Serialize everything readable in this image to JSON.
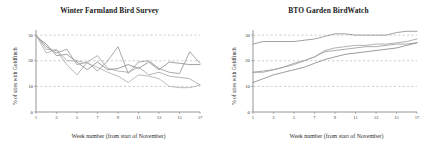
{
  "figure": {
    "panel_count": 2
  },
  "axis_common": {
    "ylabel": "% of sites with Goldfinch",
    "xlabel": "Week number (from start of November)",
    "yticks": [
      "0",
      "10",
      "20",
      "30"
    ],
    "xticks": [
      "1",
      "3",
      "5",
      "7",
      "9",
      "11",
      "13",
      "15",
      "17"
    ],
    "gridline_color": "#b9b9b9",
    "axis_color": "#8a8a8a"
  },
  "chart_data": [
    {
      "type": "line",
      "title": "Winter Farmland Bird Survey",
      "xlabel": "Week number (from start of November)",
      "ylabel": "% of sites with Goldfinch",
      "x": [
        1,
        2,
        3,
        4,
        5,
        6,
        7,
        8,
        9,
        10,
        11,
        12,
        13,
        14,
        15,
        16,
        17
      ],
      "xlim": [
        1,
        17
      ],
      "ylim": [
        0,
        32
      ],
      "yticks": [
        0,
        10,
        20,
        30
      ],
      "xticks": [
        1,
        3,
        5,
        7,
        9,
        11,
        13,
        15,
        17
      ],
      "grid": "horizontal-dashed",
      "legend": "none",
      "series": [
        {
          "name": "series-1",
          "color": "#9a9a9a",
          "values": [
            30.0,
            25.5,
            23.0,
            24.5,
            18.5,
            19.5,
            16.0,
            20.0,
            25.5,
            15.0,
            19.5,
            20.0,
            17.0,
            15.5,
            15.0,
            23.5,
            19.0
          ]
        },
        {
          "name": "series-2",
          "color": "#a8a8a8",
          "values": [
            30.0,
            24.5,
            24.0,
            18.5,
            14.5,
            19.5,
            22.0,
            17.0,
            16.0,
            15.5,
            17.5,
            14.5,
            15.5,
            14.0,
            13.5,
            13.0,
            10.5
          ]
        },
        {
          "name": "series-3",
          "color": "#8f8f8f",
          "values": [
            29.5,
            26.5,
            22.0,
            22.5,
            19.5,
            16.5,
            19.5,
            16.5,
            17.0,
            18.5,
            17.0,
            19.5,
            16.5,
            19.5,
            19.0,
            18.5,
            18.5
          ]
        },
        {
          "name": "series-4",
          "color": "#b0b0b0",
          "values": [
            30.0,
            23.0,
            24.5,
            20.0,
            20.0,
            19.0,
            17.5,
            15.5,
            14.0,
            11.5,
            14.5,
            14.0,
            13.0,
            10.0,
            9.5,
            9.5,
            10.5
          ]
        }
      ]
    },
    {
      "type": "line",
      "title": "BTO Garden BirdWatch",
      "xlabel": "Week number (from start of November)",
      "ylabel": "% of sites with Goldfinch",
      "x": [
        1,
        2,
        3,
        4,
        5,
        6,
        7,
        8,
        9,
        10,
        11,
        12,
        13,
        14,
        15,
        16,
        17
      ],
      "xlim": [
        1,
        17
      ],
      "ylim": [
        0,
        32
      ],
      "yticks": [
        0,
        10,
        20,
        30
      ],
      "xticks": [
        1,
        3,
        5,
        7,
        9,
        11,
        13,
        15,
        17
      ],
      "grid": "horizontal-dashed",
      "legend": "none",
      "series": [
        {
          "name": "series-1",
          "color": "#8f8f8f",
          "values": [
            26.5,
            27.5,
            27.5,
            27.5,
            27.5,
            28.0,
            28.5,
            29.5,
            30.5,
            30.5,
            30.0,
            30.0,
            30.0,
            30.0,
            31.0,
            31.5,
            31.5
          ]
        },
        {
          "name": "series-2",
          "color": "#a3a3a3",
          "values": [
            15.5,
            15.5,
            16.5,
            17.5,
            18.5,
            20.0,
            21.5,
            24.0,
            25.0,
            25.5,
            26.0,
            26.0,
            26.5,
            26.5,
            27.0,
            27.5,
            28.5
          ]
        },
        {
          "name": "series-3",
          "color": "#9c9c9c",
          "values": [
            15.5,
            16.0,
            16.5,
            17.5,
            19.0,
            20.0,
            21.5,
            23.5,
            24.0,
            24.5,
            25.0,
            25.5,
            25.5,
            26.0,
            26.5,
            26.5,
            27.0
          ]
        },
        {
          "name": "series-4",
          "color": "#8a8a8a",
          "values": [
            11.5,
            13.0,
            14.5,
            15.5,
            16.5,
            17.5,
            19.0,
            20.5,
            21.5,
            22.5,
            23.0,
            23.5,
            24.0,
            24.5,
            25.0,
            26.0,
            27.0
          ]
        }
      ]
    }
  ]
}
